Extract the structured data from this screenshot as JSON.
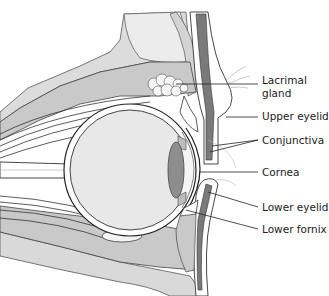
{
  "diagram": {
    "labels": [
      {
        "id": "lacrimal-gland",
        "text": "Lacrimal gland"
      },
      {
        "id": "upper-eyelid",
        "text": "Upper eyelid"
      },
      {
        "id": "conjunctiva",
        "text": "Conjunctiva"
      },
      {
        "id": "cornea",
        "text": "Cornea"
      },
      {
        "id": "lower-eyelid",
        "text": "Lower eyelid"
      },
      {
        "id": "lower-fornix",
        "text": "Lower fornix"
      }
    ],
    "colors": {
      "bone": "#d9d9d9",
      "tissue": "#c8c8c8",
      "eyeball": "#e6e6e6",
      "lens": "#8c8c8c",
      "muscle": "#7a7a7a",
      "outline": "#333333",
      "gland": "#f4f4f4"
    }
  }
}
